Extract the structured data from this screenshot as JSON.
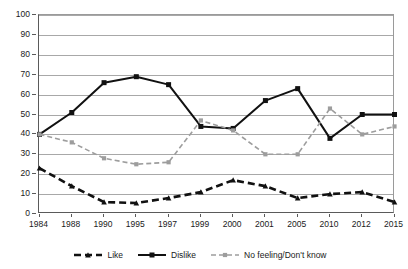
{
  "chart_data": {
    "type": "line",
    "title": "",
    "subtitle": "",
    "xlabel": "",
    "ylabel": "",
    "ylim": [
      0,
      100
    ],
    "ytick_step": 10,
    "yticks": [
      0,
      10,
      20,
      30,
      40,
      50,
      60,
      70,
      80,
      90,
      100
    ],
    "grid": true,
    "grid_axis": "y",
    "legend_position": "bottom",
    "categories": [
      "1984",
      "1988",
      "1990",
      "1995",
      "1997",
      "1999",
      "2000",
      "2001",
      "2005",
      "2010",
      "2012",
      "2015"
    ],
    "series": [
      {
        "name": "Like",
        "values": [
          23,
          14,
          6,
          5.5,
          8,
          11,
          17,
          14,
          8,
          10,
          11,
          6
        ],
        "color": "#111111",
        "line_style": "dashed",
        "marker": "triangle",
        "line_width": 2.6
      },
      {
        "name": "Dislike",
        "values": [
          40,
          51,
          66,
          69,
          65,
          44,
          43,
          57,
          63,
          38,
          50,
          50
        ],
        "color": "#111111",
        "line_style": "solid",
        "marker": "square",
        "line_width": 2.0
      },
      {
        "name": "No feeling/Don't know",
        "values": [
          40,
          36,
          28,
          25,
          26,
          47,
          42,
          30,
          30,
          53,
          40,
          44
        ],
        "color": "#9d9d9d",
        "line_style": "dashed",
        "marker": "square",
        "line_width": 1.6
      }
    ]
  },
  "legend": {
    "items": [
      {
        "label": "Like"
      },
      {
        "label": "Dislike"
      },
      {
        "label": "No feeling/Don't know"
      }
    ]
  },
  "axes": {
    "y_labels": [
      "100",
      "90",
      "80",
      "70",
      "60",
      "50",
      "40",
      "30",
      "20",
      "10",
      "0"
    ],
    "x_labels": [
      "1984",
      "1988",
      "1990",
      "1995",
      "1997",
      "1999",
      "2000",
      "2001",
      "2005",
      "2010",
      "2012",
      "2015"
    ]
  }
}
